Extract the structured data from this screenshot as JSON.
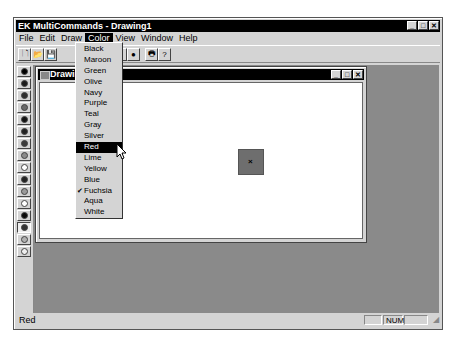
{
  "window": {
    "title": "EK MultiCommands - Drawing1",
    "controls": {
      "minimize": "_",
      "maximize": "□",
      "close": "✕"
    }
  },
  "menubar": {
    "items": [
      {
        "label": "File"
      },
      {
        "label": "Edit"
      },
      {
        "label": "Draw"
      },
      {
        "label": "Color",
        "active": true
      },
      {
        "label": "View"
      },
      {
        "label": "Window"
      },
      {
        "label": "Help"
      }
    ]
  },
  "toolbar": {
    "buttons": [
      {
        "name": "new-file",
        "glyph": "🗋"
      },
      {
        "name": "open-file",
        "glyph": "📂"
      },
      {
        "name": "save",
        "glyph": "💾"
      },
      {
        "name": "shape",
        "glyph": "■"
      },
      {
        "name": "ellipse",
        "glyph": "●"
      },
      {
        "name": "print",
        "glyph": "🖶"
      },
      {
        "name": "help",
        "glyph": "?"
      }
    ]
  },
  "palette": {
    "buttons": [
      {
        "color": "#000000"
      },
      {
        "color": "#1a1a1a"
      },
      {
        "color": "#2e2e2e"
      },
      {
        "color": "#6a6a6a"
      },
      {
        "color": "#111111"
      },
      {
        "color": "#222222"
      },
      {
        "color": "#3a3a3a"
      },
      {
        "color": "#8a8a8a"
      },
      {
        "color": "#ffffff"
      },
      {
        "color": "#222222"
      },
      {
        "color": "#9a9a9a"
      },
      {
        "color": "#ffffff"
      },
      {
        "color": "#0a0a0a"
      },
      {
        "color": "#333333",
        "pressed": true
      },
      {
        "color": "#b0b0b0"
      },
      {
        "color": "#eeeeee"
      }
    ]
  },
  "child_window": {
    "title": "Drawing1",
    "controls": {
      "minimize": "_",
      "maximize": "□",
      "close": "✕"
    },
    "shape": {
      "fill": "#6e6e6e",
      "marker": "×"
    }
  },
  "color_menu": {
    "items": [
      {
        "label": "Black"
      },
      {
        "label": "Maroon"
      },
      {
        "label": "Green"
      },
      {
        "label": "Olive"
      },
      {
        "label": "Navy"
      },
      {
        "label": "Purple"
      },
      {
        "label": "Teal"
      },
      {
        "label": "Gray"
      },
      {
        "label": "Silver"
      },
      {
        "label": "Red",
        "highlighted": true
      },
      {
        "label": "Lime"
      },
      {
        "label": "Yellow"
      },
      {
        "label": "Blue"
      },
      {
        "label": "Fuchsia",
        "checked": true
      },
      {
        "label": "Aqua"
      },
      {
        "label": "White"
      }
    ],
    "check_glyph": "✔"
  },
  "statusbar": {
    "message": "Red",
    "num_indicator": "NUM"
  }
}
